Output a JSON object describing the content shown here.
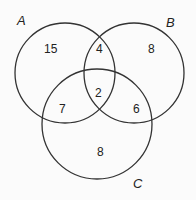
{
  "diagram": {
    "type": "venn-3",
    "sets": [
      {
        "label": "A",
        "cx": 65,
        "cy": 73,
        "r": 50
      },
      {
        "label": "B",
        "cx": 134,
        "cy": 73,
        "r": 50
      },
      {
        "label": "C",
        "cx": 97,
        "cy": 124,
        "r": 55
      }
    ],
    "regions": {
      "A_only": "15",
      "B_only": "8",
      "C_only": "8",
      "A_B_only": "4",
      "A_C_only": "7",
      "B_C_only": "6",
      "A_B_C": "2"
    },
    "colors": {
      "stroke": "#333333",
      "text": "#222222",
      "background": "#fbfbfb"
    }
  }
}
